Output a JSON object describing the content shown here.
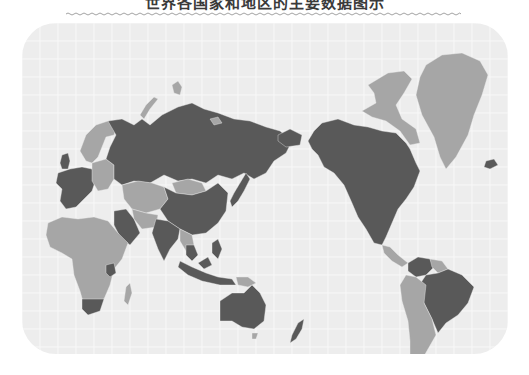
{
  "title": "世界各国家和地区的主要数据图示",
  "map": {
    "projection": "Pacific-centered world map",
    "background_color": "#ededed",
    "grid_color": "#f8f8f8",
    "categories": [
      {
        "id": "dark",
        "color": "#595959"
      },
      {
        "id": "light",
        "color": "#a6a6a6"
      }
    ],
    "regions": [
      {
        "name": "Russia",
        "category": "dark"
      },
      {
        "name": "Novaya Zemlya",
        "category": "light"
      },
      {
        "name": "Svalbard",
        "category": "light"
      },
      {
        "name": "Franz Josef Land",
        "category": "light"
      },
      {
        "name": "Scandinavia",
        "category": "light"
      },
      {
        "name": "Western Europe",
        "category": "dark"
      },
      {
        "name": "United Kingdom",
        "category": "dark"
      },
      {
        "name": "Eastern Europe",
        "category": "light"
      },
      {
        "name": "Kazakhstan and Central Asia",
        "category": "light"
      },
      {
        "name": "Mongolia",
        "category": "light"
      },
      {
        "name": "China",
        "category": "dark"
      },
      {
        "name": "Japan",
        "category": "dark"
      },
      {
        "name": "Middle East",
        "category": "dark"
      },
      {
        "name": "Iran and Afghanistan",
        "category": "light"
      },
      {
        "name": "India",
        "category": "dark"
      },
      {
        "name": "Southeast Asia mainland",
        "category": "light"
      },
      {
        "name": "Thailand",
        "category": "dark"
      },
      {
        "name": "Indonesia",
        "category": "dark"
      },
      {
        "name": "Philippines",
        "category": "dark"
      },
      {
        "name": "Papua New Guinea",
        "category": "light"
      },
      {
        "name": "Africa",
        "category": "light"
      },
      {
        "name": "South Africa",
        "category": "dark"
      },
      {
        "name": "Kenya",
        "category": "dark"
      },
      {
        "name": "Madagascar",
        "category": "light"
      },
      {
        "name": "Australia",
        "category": "dark"
      },
      {
        "name": "Tasmania",
        "category": "light"
      },
      {
        "name": "New Zealand",
        "category": "dark"
      },
      {
        "name": "Greenland",
        "category": "light"
      },
      {
        "name": "Canadian Arctic Islands",
        "category": "light"
      },
      {
        "name": "Iceland",
        "category": "dark"
      },
      {
        "name": "North America",
        "category": "dark"
      },
      {
        "name": "Central America",
        "category": "light"
      },
      {
        "name": "Brazil",
        "category": "dark"
      },
      {
        "name": "Venezuela and Colombia",
        "category": "dark"
      },
      {
        "name": "Guianas",
        "category": "light"
      },
      {
        "name": "Andean and Southern Cone",
        "category": "light"
      }
    ]
  }
}
